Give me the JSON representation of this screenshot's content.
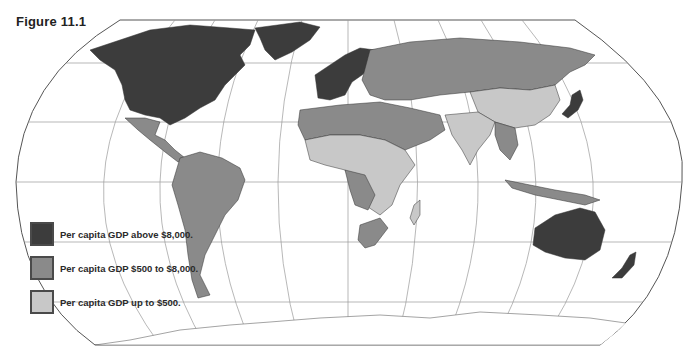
{
  "figure": {
    "title": "Figure 11.1"
  },
  "legend": {
    "items": [
      {
        "label": "Per capita GDP above $8,000.",
        "color": "#3c3c3c",
        "category": "high"
      },
      {
        "label": "Per capita GDP $500 to $8,000.",
        "color": "#8a8a8a",
        "category": "middle"
      },
      {
        "label": "Per capita GDP up to $500.",
        "color": "#c8c8c8",
        "category": "low"
      }
    ]
  },
  "map": {
    "projection": "Robinson-style world map with graticule",
    "ocean_color": "#ffffff",
    "gridline_color": "#888888",
    "regions": [
      {
        "name": "North America (USA, Canada)",
        "category": "high"
      },
      {
        "name": "Greenland",
        "category": "high"
      },
      {
        "name": "Western Europe",
        "category": "high"
      },
      {
        "name": "Japan",
        "category": "high"
      },
      {
        "name": "Australia",
        "category": "high"
      },
      {
        "name": "New Zealand",
        "category": "high"
      },
      {
        "name": "Mexico & Central America",
        "category": "middle"
      },
      {
        "name": "South America",
        "category": "middle"
      },
      {
        "name": "Russia / USSR",
        "category": "middle"
      },
      {
        "name": "Eastern Europe",
        "category": "middle"
      },
      {
        "name": "Middle East & North Africa",
        "category": "middle"
      },
      {
        "name": "Southern Africa",
        "category": "middle"
      },
      {
        "name": "Southeast Asia (part)",
        "category": "middle"
      },
      {
        "name": "China",
        "category": "low"
      },
      {
        "name": "India & South Asia",
        "category": "low"
      },
      {
        "name": "Sub-Saharan Africa (most)",
        "category": "low"
      },
      {
        "name": "Madagascar",
        "category": "low"
      }
    ]
  }
}
